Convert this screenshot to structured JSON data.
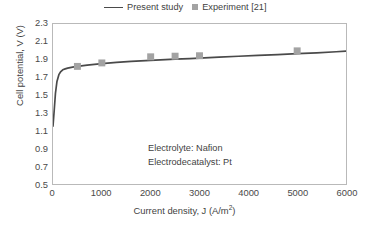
{
  "chart_data": {
    "type": "line",
    "title": "",
    "xlabel": "Current density, J (A/m2)",
    "xlabel_base": "Current density, J (A/m",
    "xlabel_exponent": "2",
    "xlabel_suffix": ")",
    "ylabel": "Cell potential, V (V)",
    "xlim": [
      0,
      6000
    ],
    "ylim": [
      0.5,
      2.3
    ],
    "xticks": [
      0,
      1000,
      2000,
      3000,
      4000,
      5000,
      6000
    ],
    "xtick_labels": [
      "0",
      "1000",
      "2000",
      "3000",
      "4000",
      "5000",
      "6000"
    ],
    "yticks": [
      0.5,
      0.7,
      0.9,
      1.1,
      1.3,
      1.5,
      1.7,
      1.9,
      2.1,
      2.3
    ],
    "ytick_labels": [
      "0.5",
      "0.7",
      "0.9",
      "1.1",
      "1.3",
      "1.5",
      "1.7",
      "1.9",
      "2.1",
      "2.3"
    ],
    "grid": false,
    "legend_position": "top-center",
    "series": [
      {
        "name": "Present study",
        "type": "line",
        "color": "#4a4a4a",
        "marker": "none",
        "x": [
          0,
          25,
          50,
          80,
          120,
          160,
          200,
          250,
          300,
          400,
          500,
          700,
          1000,
          1300,
          1600,
          2000,
          2300,
          2500,
          2800,
          3000,
          3400,
          3800,
          4200,
          4600,
          5000,
          5400,
          5800,
          6000
        ],
        "y": [
          1.15,
          1.33,
          1.52,
          1.65,
          1.73,
          1.765,
          1.785,
          1.795,
          1.803,
          1.815,
          1.824,
          1.838,
          1.855,
          1.868,
          1.879,
          1.891,
          1.899,
          1.904,
          1.911,
          1.916,
          1.927,
          1.937,
          1.947,
          1.956,
          1.966,
          1.976,
          1.988,
          1.995
        ]
      },
      {
        "name": "Experiment [21]",
        "type": "scatter",
        "color": "#a3a3a3",
        "marker": "square",
        "x": [
          500,
          1000,
          2000,
          2500,
          3000,
          5000
        ],
        "y": [
          1.823,
          1.862,
          1.931,
          1.938,
          1.943,
          1.998
        ]
      }
    ],
    "annotations": [
      "Electrolyte: Nafion",
      "Electrodecatalyst: Pt"
    ]
  },
  "legend": {
    "entries": [
      {
        "label": "Present study",
        "swatch": "line"
      },
      {
        "label": "Experiment [21]",
        "swatch": "square"
      }
    ]
  },
  "colors": {
    "line": "#4a4a4a",
    "marker": "#a3a3a3",
    "frame": "#b9b9b9",
    "text": "#3f3f3f",
    "background": "#ffffff"
  }
}
